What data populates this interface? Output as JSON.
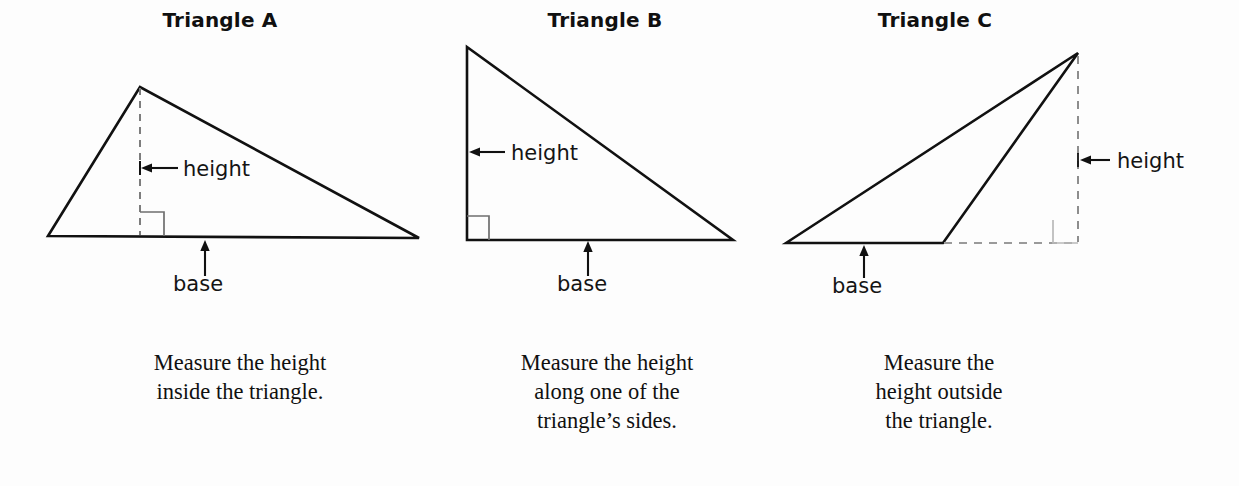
{
  "page": {
    "background_color": "#fdfdfd",
    "ink_color": "#111111",
    "dash_color": "#9b9b9b"
  },
  "figures": [
    {
      "id": "triangle-a",
      "title": "Triangle A",
      "height_label": "height",
      "base_label": "base",
      "caption_lines": [
        "Measure the height",
        "inside the triangle."
      ],
      "height_position": "inside",
      "right_angle_marker": true,
      "geometry": {
        "vertices": [
          [
            48,
            236
          ],
          [
            140,
            87
          ],
          [
            419,
            238
          ]
        ],
        "height_segment": [
          [
            140,
            87
          ],
          [
            140,
            236
          ]
        ],
        "height_segment_style": "dashed",
        "right_angle_square": [
          [
            140,
            212
          ],
          [
            164,
            212
          ],
          [
            164,
            236
          ]
        ],
        "base_arrow": [
          [
            205,
            274
          ],
          [
            205,
            242
          ]
        ],
        "height_arrow": [
          [
            178,
            168
          ],
          [
            143,
            168
          ]
        ]
      }
    },
    {
      "id": "triangle-b",
      "title": "Triangle B",
      "height_label": "height",
      "base_label": "base",
      "caption_lines": [
        "Measure the height",
        "along one of the",
        "triangle’s sides."
      ],
      "height_position": "on-side",
      "right_angle_marker": true,
      "geometry": {
        "vertices": [
          [
            467,
            47
          ],
          [
            467,
            240
          ],
          [
            733,
            240
          ]
        ],
        "height_segment": [
          [
            467,
            47
          ],
          [
            467,
            240
          ]
        ],
        "height_segment_style": "solid",
        "right_angle_square": [
          [
            467,
            216
          ],
          [
            489,
            216
          ],
          [
            489,
            240
          ]
        ],
        "base_arrow": [
          [
            588,
            274
          ],
          [
            588,
            243
          ]
        ],
        "height_arrow": [
          [
            505,
            152
          ],
          [
            470,
            152
          ]
        ]
      }
    },
    {
      "id": "triangle-c",
      "title": "Triangle C",
      "height_label": "height",
      "base_label": "base",
      "caption_lines": [
        "Measure the",
        "height outside",
        "the triangle."
      ],
      "height_position": "outside",
      "right_angle_marker": true,
      "geometry": {
        "vertices": [
          [
            786,
            243
          ],
          [
            1078,
            53
          ],
          [
            943,
            243
          ]
        ],
        "height_segment": [
          [
            1078,
            53
          ],
          [
            1078,
            243
          ]
        ],
        "height_segment_style": "dashed",
        "base_extension": [
          [
            943,
            243
          ],
          [
            1078,
            243
          ]
        ],
        "base_extension_style": "dashed",
        "right_angle_square": [
          [
            1053,
            220
          ],
          [
            1053,
            243
          ],
          [
            1078,
            243
          ]
        ],
        "base_arrow": [
          [
            864,
            276
          ],
          [
            864,
            246
          ]
        ],
        "height_arrow": [
          [
            1110,
            160
          ],
          [
            1081,
            160
          ]
        ]
      }
    }
  ],
  "labels": {
    "triangle_a_height_xy": [
      185,
      157
    ],
    "triangle_a_base_xy": [
      175,
      277
    ],
    "triangle_b_height_xy": [
      512,
      141
    ],
    "triangle_b_base_xy": [
      558,
      277
    ],
    "triangle_c_height_xy": [
      1118,
      149
    ],
    "triangle_c_base_xy": [
      834,
      279
    ]
  }
}
